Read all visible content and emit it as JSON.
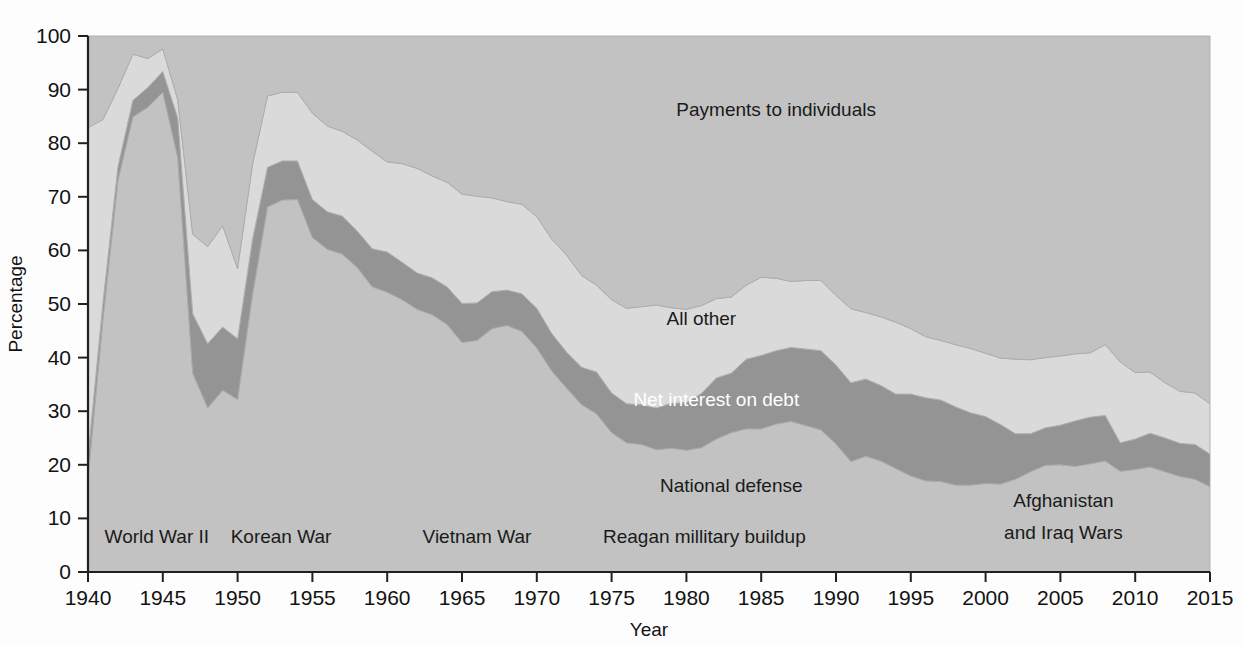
{
  "chart_data": {
    "type": "area",
    "stacked": true,
    "title": "",
    "xlabel": "Year",
    "ylabel": "Percentage",
    "xlim": [
      1940,
      2015
    ],
    "ylim": [
      0,
      100
    ],
    "grid": false,
    "legend_position": "inline-annotations",
    "x_ticks": [
      "1940",
      "1945",
      "1950",
      "1955",
      "1960",
      "1965",
      "1970",
      "1975",
      "1980",
      "1985",
      "1990",
      "1995",
      "2000",
      "2005",
      "2010",
      "2015"
    ],
    "y_ticks": [
      "0",
      "10",
      "20",
      "30",
      "40",
      "50",
      "60",
      "70",
      "80",
      "90",
      "100"
    ],
    "x": [
      1940,
      1941,
      1942,
      1943,
      1944,
      1945,
      1946,
      1947,
      1948,
      1949,
      1950,
      1951,
      1952,
      1953,
      1954,
      1955,
      1956,
      1957,
      1958,
      1959,
      1960,
      1961,
      1962,
      1963,
      1964,
      1965,
      1966,
      1967,
      1968,
      1969,
      1970,
      1971,
      1972,
      1973,
      1974,
      1975,
      1976,
      1977,
      1978,
      1979,
      1980,
      1981,
      1982,
      1983,
      1984,
      1985,
      1986,
      1987,
      1988,
      1989,
      1990,
      1991,
      1992,
      1993,
      1994,
      1995,
      1996,
      1997,
      1998,
      1999,
      2000,
      2001,
      2002,
      2003,
      2004,
      2005,
      2006,
      2007,
      2008,
      2009,
      2010,
      2011,
      2012,
      2013,
      2014,
      2015
    ],
    "series": [
      {
        "name": "National defense",
        "color": "#c2c2c2",
        "label_position": {
          "x": 1983,
          "y": 15
        },
        "values": [
          17.5,
          47.1,
          73.0,
          84.9,
          86.7,
          89.5,
          77.3,
          37.1,
          30.6,
          33.9,
          32.2,
          51.8,
          68.1,
          69.4,
          69.5,
          62.4,
          60.2,
          59.3,
          56.8,
          53.2,
          52.2,
          50.8,
          49.0,
          48.0,
          46.2,
          42.8,
          43.2,
          45.4,
          46.0,
          44.9,
          41.8,
          37.5,
          34.3,
          31.2,
          29.5,
          26.0,
          24.1,
          23.8,
          22.8,
          23.1,
          22.7,
          23.2,
          24.8,
          26.0,
          26.7,
          26.7,
          27.6,
          28.1,
          27.3,
          26.5,
          23.9,
          20.6,
          21.6,
          20.7,
          19.3,
          17.9,
          17.0,
          16.9,
          16.2,
          16.2,
          16.5,
          16.4,
          17.3,
          18.7,
          19.9,
          20.0,
          19.7,
          20.2,
          20.7,
          18.8,
          19.1,
          19.6,
          18.7,
          17.8,
          17.3,
          15.9
        ]
      },
      {
        "name": "Net interest on debt",
        "color": "#949494",
        "label_position": {
          "x": 1982,
          "y": 31
        },
        "values": [
          4.1,
          3.2,
          2.6,
          3.1,
          3.7,
          3.9,
          7.4,
          11.1,
          12.0,
          11.8,
          11.3,
          10.3,
          7.4,
          7.3,
          7.2,
          7.1,
          7.0,
          7.1,
          6.8,
          7.1,
          7.5,
          7.0,
          6.8,
          6.9,
          7.0,
          7.3,
          7.0,
          6.9,
          6.6,
          7.0,
          7.4,
          7.0,
          6.7,
          7.0,
          7.8,
          7.4,
          7.3,
          7.4,
          7.8,
          8.4,
          8.9,
          10.1,
          11.4,
          11.1,
          13.0,
          13.7,
          13.7,
          13.8,
          14.3,
          14.8,
          14.7,
          14.7,
          14.4,
          14.1,
          13.9,
          15.3,
          15.5,
          15.2,
          14.6,
          13.5,
          12.5,
          11.1,
          8.5,
          7.1,
          7.0,
          7.4,
          8.5,
          8.7,
          8.5,
          5.3,
          5.7,
          6.3,
          6.3,
          6.2,
          6.5,
          6.1
        ]
      },
      {
        "name": "All other",
        "color": "#dadada",
        "label_position": {
          "x": 1981,
          "y": 46
        },
        "values": [
          61.3,
          34.1,
          14.6,
          8.6,
          5.4,
          4.2,
          3.4,
          14.8,
          18.1,
          18.9,
          13.1,
          14.0,
          13.3,
          12.8,
          12.8,
          16.1,
          16.0,
          15.8,
          17.0,
          18.2,
          16.8,
          18.4,
          19.5,
          19.0,
          19.5,
          20.4,
          19.9,
          17.5,
          16.5,
          16.7,
          17.1,
          17.6,
          18.1,
          17.1,
          16.2,
          17.4,
          17.8,
          18.3,
          19.2,
          17.8,
          17.4,
          16.4,
          14.8,
          14.2,
          13.8,
          14.6,
          13.5,
          12.3,
          12.8,
          13.1,
          13.0,
          13.8,
          12.4,
          12.8,
          13.4,
          12.2,
          11.4,
          11.1,
          11.6,
          12.0,
          11.8,
          12.4,
          13.9,
          13.8,
          13.1,
          12.9,
          12.5,
          12.0,
          13.2,
          15.1,
          12.4,
          11.4,
          10.3,
          9.7,
          9.6,
          9.4
        ]
      },
      {
        "name": "Payments to individuals",
        "color": "#c2c2c2",
        "label_position": {
          "x": 1986,
          "y": 85
        },
        "values": [
          17.1,
          15.6,
          9.8,
          3.4,
          4.2,
          2.4,
          11.9,
          37.0,
          39.3,
          35.4,
          43.4,
          23.9,
          11.2,
          10.5,
          10.5,
          14.4,
          16.8,
          17.8,
          19.4,
          21.5,
          23.5,
          23.8,
          24.7,
          26.1,
          27.3,
          29.5,
          29.9,
          30.2,
          30.9,
          31.4,
          33.7,
          37.9,
          40.9,
          44.7,
          46.5,
          49.2,
          50.8,
          50.5,
          50.2,
          50.7,
          51.0,
          50.3,
          49.0,
          48.7,
          46.5,
          45.0,
          45.2,
          45.8,
          45.6,
          45.6,
          48.4,
          50.9,
          51.6,
          52.4,
          53.4,
          54.6,
          56.1,
          56.8,
          57.6,
          58.3,
          59.2,
          60.1,
          60.3,
          60.4,
          60.0,
          59.7,
          59.3,
          59.1,
          57.6,
          60.8,
          62.8,
          62.7,
          64.7,
          66.3,
          66.6,
          68.6
        ]
      }
    ],
    "annotations": [
      {
        "name": "world-war-ii",
        "text": "World War II",
        "x": 1944.6,
        "y": 5.4
      },
      {
        "name": "korean-war",
        "text": "Korean War",
        "x": 1952.9,
        "y": 5.4
      },
      {
        "name": "vietnam-war",
        "text": "Vietnam War",
        "x": 1966.0,
        "y": 5.4
      },
      {
        "name": "reagan-military-buildup",
        "text": "Reagan millitary buildup",
        "x": 1981.2,
        "y": 5.4
      },
      {
        "name": "afghanistan-iraq-wars-line1",
        "text": "Afghanistan",
        "x": 2005.2,
        "y": 12.2
      },
      {
        "name": "afghanistan-iraq-wars-line2",
        "text": "and Iraq Wars",
        "x": 2005.2,
        "y": 6.2
      }
    ]
  }
}
